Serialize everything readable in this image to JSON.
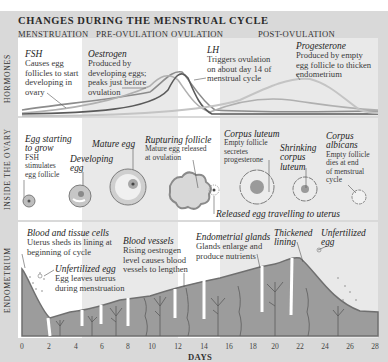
{
  "title": "CHANGES DURING THE MENSTRUAL CYCLE",
  "phases": [
    {
      "label": "MENSTRUATION"
    },
    {
      "label": "PRE-OVULATION"
    },
    {
      "label": "OVULATION"
    },
    {
      "label": "POST-OVULATION"
    }
  ],
  "sections": {
    "hormones": "HORMONES",
    "ovary": "INSIDE THE OVARY",
    "endometrium": "ENDOMETRIUM"
  },
  "hormones": {
    "fsh": {
      "heading": "FSH",
      "text": [
        "Causes egg",
        "follicles to start",
        "developing in",
        "ovary"
      ]
    },
    "oestrogen": {
      "heading": "Oestrogen",
      "text": [
        "Produced by",
        "developing eggs;",
        "peaks just before",
        "ovulation"
      ]
    },
    "lh": {
      "heading": "LH",
      "text": [
        "Triggers ovulation",
        "on about day 14 of",
        "menstrual cycle"
      ]
    },
    "progesterone": {
      "heading": "Progesterone",
      "text": [
        "Produced by empty",
        "egg follicle to thicken",
        "endometrium"
      ]
    }
  },
  "ovary": {
    "egg_starting": {
      "heading": [
        "Egg starting",
        "to grow"
      ],
      "text": [
        "FSH",
        "stimulates",
        "egg follicle"
      ]
    },
    "developing_egg": {
      "heading": [
        "Developing",
        "egg"
      ]
    },
    "mature_egg": {
      "heading": "Mature egg"
    },
    "rupturing_follicle": {
      "heading": "Rupturing follicle",
      "text": [
        "Mature egg released",
        "at ovulation"
      ]
    },
    "corpus_luteum": {
      "heading": "Corpus luteum",
      "text": [
        "Empty follicle",
        "secretes",
        "progesterone"
      ]
    },
    "shrinking": {
      "heading": [
        "Shrinking",
        "corpus",
        "luteum"
      ]
    },
    "corpus_albicans": {
      "heading": [
        "Corpus",
        "albicans"
      ],
      "text": [
        "Empty follicle",
        "dies at end",
        "of menstrual",
        "cycle"
      ]
    },
    "released_egg": "Released egg travelling to uterus"
  },
  "endometrium": {
    "blood_tissue": {
      "heading": "Blood and tissue cells",
      "text": [
        "Uterus sheds its lining at",
        "beginning of cycle"
      ]
    },
    "unfertilized_1": {
      "heading": "Unfertilized egg",
      "text": [
        "Egg leaves uterus",
        "during menstruation"
      ]
    },
    "blood_vessels": {
      "heading": "Blood vessels",
      "text": [
        "Rising oestrogen",
        "level causes blood",
        "vessels to lengthen"
      ]
    },
    "glands": {
      "heading": "Endometrial glands",
      "text": [
        "Glands enlarge and",
        "produce nutrients"
      ]
    },
    "thickened": {
      "heading": [
        "Thickened",
        "lining"
      ]
    },
    "unfertilized_2": {
      "heading": [
        "Unfertilized",
        "egg"
      ]
    }
  },
  "axis": {
    "label": "DAYS",
    "ticks": [
      "0",
      "2",
      "4",
      "6",
      "8",
      "10",
      "12",
      "14",
      "16",
      "18",
      "20",
      "22",
      "24",
      "26",
      "28"
    ]
  },
  "colors": {
    "frame": "#d9d9d9",
    "column_tint": "#e9e9e9",
    "tissue": "#9a9a9a",
    "tissue_edge": "#6f6f6f",
    "follicle": "#a8a8a8"
  }
}
